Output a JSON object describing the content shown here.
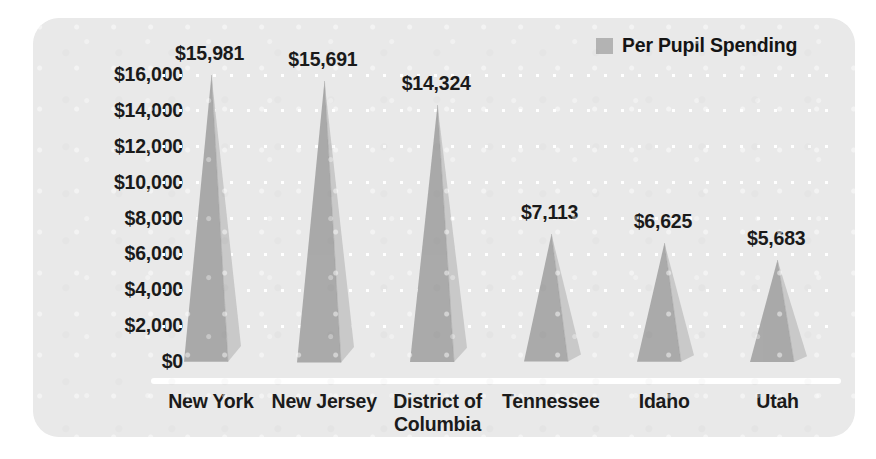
{
  "chart_data": {
    "type": "bar",
    "title": "",
    "subtitle": "",
    "xlabel": "",
    "ylabel": "",
    "categories": [
      "New York",
      "New Jersey",
      "District of\nColumbia",
      "Tennessee",
      "Idaho",
      "Utah"
    ],
    "values": [
      15981,
      15691,
      14324,
      7113,
      6625,
      5683
    ],
    "value_labels": [
      "$15,981",
      "$15,691",
      "$14,324",
      "$7,113",
      "$6,625",
      "$5,683"
    ],
    "series": [
      {
        "name": "Per Pupil Spending",
        "values": [
          15981,
          15691,
          14324,
          7113,
          6625,
          5683
        ]
      }
    ],
    "ylim": [
      0,
      16000
    ],
    "ytick_values": [
      0,
      2000,
      4000,
      6000,
      8000,
      10000,
      12000,
      14000,
      16000
    ],
    "ytick_labels": [
      "$16,000",
      "$14,000",
      "$12,000",
      "$10,000",
      "$8,000",
      "$6,000",
      "$4,000",
      "$2,000",
      "$0"
    ],
    "grid": true,
    "grid_style": "dotted",
    "grid_color": "#ffffff",
    "legend": {
      "position": "top-right",
      "entries": [
        {
          "label": "Per Pupil Spending",
          "color": "#b3b3b3"
        }
      ]
    },
    "marker_style": "3d-pyramid",
    "colors": {
      "panel_background": "#e9e9e9",
      "page_background": "#ffffff",
      "bar_left_face": "#aaaaaa",
      "bar_right_face": "#c9c9c9",
      "bar_edge": "#9a9a9a",
      "text": "#1b1b1b",
      "baseline": "#ffffff"
    }
  }
}
